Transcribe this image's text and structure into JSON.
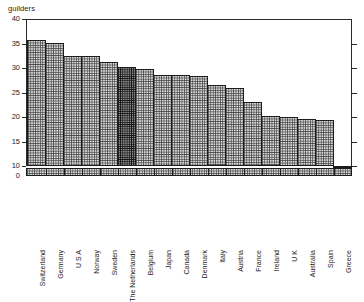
{
  "chart_data": {
    "type": "bar",
    "title": "",
    "subtitle": "",
    "xlabel": "",
    "ylabel": "guilders",
    "ylim": [
      0,
      40
    ],
    "yticks": [
      0,
      10,
      15,
      20,
      25,
      30,
      35,
      40
    ],
    "ytick_labels": [
      "0",
      "10",
      "15",
      "20",
      "25",
      "30",
      "35",
      "40"
    ],
    "grid": false,
    "legend": null,
    "axis_break": true,
    "axis_break_note": "compressed band between 0 and 10",
    "right_axis_ticks": [
      10,
      15,
      20,
      25,
      30,
      35
    ],
    "categories": [
      "Switzerland",
      "Germany",
      "U S A",
      "Norway",
      "Sweden",
      "The Netherlands",
      "Belgium",
      "Japan",
      "Canada",
      "Denmark",
      "Italy",
      "Austria",
      "France",
      "Ireland",
      "U K",
      "Australia",
      "Spain",
      "Greece"
    ],
    "values": [
      35.8,
      35.1,
      32.5,
      32.4,
      31.3,
      30.3,
      29.7,
      28.6,
      28.5,
      28.3,
      26.5,
      26.0,
      23.1,
      20.2,
      19.9,
      19.6,
      19.3,
      10.1
    ],
    "highlight_index": 5,
    "highlight_label": "The Netherlands",
    "colors": {
      "bar_fill": "#dcdcdc",
      "bar_hatch": "#3c3c3c",
      "bar_outline": "#1c1c1c",
      "highlight_fill": "#8d8d8d",
      "highlight_hatch": "#0f0f0f",
      "axis": "#2a2a2a",
      "background": "#ffffff",
      "text": "#1d1d1d"
    }
  }
}
